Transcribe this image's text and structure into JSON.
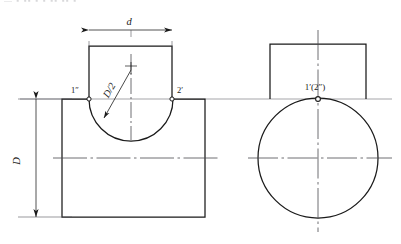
{
  "figure": {
    "type": "orthographic-projection-drawing",
    "background_color": "#ffffff",
    "line_color": "#1a1a1a",
    "thin_line_color": "#55555a",
    "center_line_color": "#4a4a4f"
  },
  "clipped_header_text": "— ▪ ▪▪ ▪ ▪ ▪▪ ▪▪ ▪",
  "dimensions": {
    "top_width": {
      "label": "d",
      "orientation": "horizontal",
      "x": 129,
      "y": 22
    },
    "left_height": {
      "label": "D",
      "orientation": "vertical-rotated",
      "x": 20,
      "y": 168
    },
    "radius_callout": {
      "label": "D/2",
      "orientation": "diagonal",
      "x": 112,
      "y": 92
    }
  },
  "point_labels": [
    {
      "name": "point-1-double-prime",
      "text": "1″",
      "x": 75,
      "y": 93
    },
    {
      "name": "point-2-prime",
      "text": "2′",
      "x": 178,
      "y": 93
    },
    {
      "name": "point-1-prime-2-double-prime",
      "text": "1′(2″)",
      "x": 314,
      "y": 88
    }
  ],
  "front_view": {
    "name": "front-view",
    "body_rect": {
      "x": 62,
      "y": 99,
      "width": 143,
      "height": 118
    },
    "top_rect": {
      "x": 89,
      "y": 46,
      "width": 83,
      "height": 53
    },
    "arc_cut": {
      "center_x": 131,
      "center_y": 99,
      "radius": 42,
      "note": "concave arc cut into top edge of body"
    },
    "center_line_vertical": {
      "x": 131,
      "y1": 54,
      "y2": 140
    },
    "center_line_horizontal": {
      "y": 158,
      "x1": 53,
      "x2": 220
    }
  },
  "side_view": {
    "name": "side-view",
    "circle": {
      "center_x": 318,
      "center_y": 158,
      "radius": 60
    },
    "top_rect": {
      "x": 270,
      "y": 44,
      "width": 96,
      "height": 55
    },
    "tangent_point": {
      "x": 318,
      "y": 99
    },
    "center_line_vertical": {
      "x": 318,
      "y1": 30,
      "y2": 232
    },
    "center_line_horizontal": {
      "y": 158,
      "x1": 248,
      "x2": 392
    }
  },
  "projection_line": {
    "y": 99,
    "x1": 20,
    "x2": 392
  }
}
